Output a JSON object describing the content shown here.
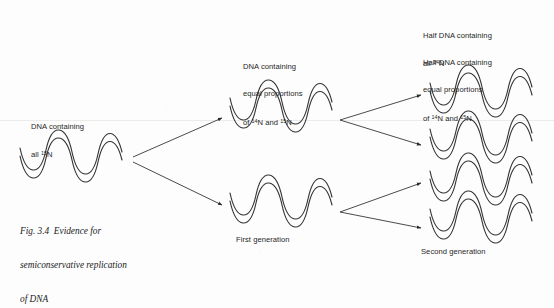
{
  "figure": {
    "caption_lines": [
      "Fig. 3.4  Evidence for",
      "semiconservative replication",
      "of DNA"
    ],
    "background_color": "#fdfdfd",
    "ink_color": "#333333"
  },
  "labels": {
    "parent": {
      "line1": "DNA containing",
      "line2_pre": "all ",
      "line2_sup": "15",
      "line2_post": "N"
    },
    "first_gen": {
      "line1": "DNA containing",
      "line2": "equal proportions",
      "line3_pre": "of ",
      "line3_sup1": "14",
      "line3_mid": "N and ",
      "line3_sup2": "15",
      "line3_post": "N"
    },
    "second_gen_a": {
      "line1": "Half DNA containing",
      "line2_pre": "all ",
      "line2_sup": "14",
      "line2_post": "N"
    },
    "second_gen_b": {
      "line1": "Half DNA containing",
      "line2": "equal proportions",
      "line3_pre": "of ",
      "line3_sup1": "14",
      "line3_mid": "N and ",
      "line3_sup2": "15",
      "line3_post": "N"
    },
    "generation_1": "First generation",
    "generation_2": "Second generation"
  },
  "diagram": {
    "helices": [
      {
        "name": "parent-dna-helix",
        "x": 18,
        "y": 160,
        "w": 104,
        "label": "all 15N"
      },
      {
        "name": "first-gen-helix-top",
        "x": 228,
        "y": 110,
        "w": 104,
        "label": "equal proportions 14N/15N"
      },
      {
        "name": "first-gen-helix-bottom",
        "x": 228,
        "y": 205,
        "w": 104,
        "label": "equal proportions 14N/15N"
      },
      {
        "name": "second-gen-helix-1",
        "x": 428,
        "y": 95,
        "w": 104,
        "label": "all 14N"
      },
      {
        "name": "second-gen-helix-2",
        "x": 428,
        "y": 141,
        "w": 104,
        "label": "equal proportions"
      },
      {
        "name": "second-gen-helix-3",
        "x": 428,
        "y": 183,
        "w": 104,
        "label": "all 14N"
      },
      {
        "name": "second-gen-helix-4",
        "x": 428,
        "y": 221,
        "w": 104,
        "label": "equal proportions"
      }
    ],
    "arrows": [
      {
        "name": "arrow-parent-to-firstgen-top",
        "x1": 133,
        "x2": 222,
        "y1": 157,
        "y2": 118
      },
      {
        "name": "arrow-parent-to-firstgen-bottom",
        "x1": 133,
        "x2": 222,
        "y1": 162,
        "y2": 205
      },
      {
        "name": "arrow-firstgen-top-to-secondgen-1",
        "x1": 340,
        "x2": 421,
        "y1": 120,
        "y2": 95
      },
      {
        "name": "arrow-firstgen-top-to-secondgen-2",
        "x1": 340,
        "x2": 421,
        "y1": 120,
        "y2": 145
      },
      {
        "name": "arrow-firstgen-bottom-to-secondgen-3",
        "x1": 340,
        "x2": 421,
        "y1": 212,
        "y2": 183
      },
      {
        "name": "arrow-firstgen-bottom-to-secondgen-4",
        "x1": 340,
        "x2": 421,
        "y1": 212,
        "y2": 228
      }
    ]
  }
}
